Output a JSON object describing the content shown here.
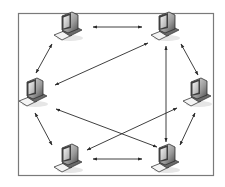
{
  "diagram": {
    "type": "mesh-network-topology",
    "frame": {
      "x": 18,
      "y": 13,
      "width": 195,
      "height": 162,
      "stroke": "#7a7a7a"
    },
    "colors": {
      "arrow": "#2a2a2a",
      "pc_dark": "#3a3a3a",
      "pc_mid": "#8c8c8c",
      "pc_light": "#d8d8d8",
      "pc_screen": "#bcbcbc"
    },
    "nodes": [
      {
        "id": "pc-top-left",
        "x": 68,
        "y": 27
      },
      {
        "id": "pc-top-right",
        "x": 165,
        "y": 27
      },
      {
        "id": "pc-mid-left",
        "x": 33,
        "y": 93
      },
      {
        "id": "pc-mid-right",
        "x": 197,
        "y": 93
      },
      {
        "id": "pc-bottom-left",
        "x": 68,
        "y": 159
      },
      {
        "id": "pc-bottom-right",
        "x": 165,
        "y": 159
      }
    ],
    "edges": [
      {
        "from": "pc-top-left",
        "to": "pc-top-right",
        "x1": 93,
        "y1": 27,
        "x2": 142,
        "y2": 27
      },
      {
        "from": "pc-top-left",
        "to": "pc-mid-left",
        "x1": 52,
        "y1": 44,
        "x2": 36,
        "y2": 73
      },
      {
        "from": "pc-top-right",
        "to": "pc-mid-right",
        "x1": 181,
        "y1": 44,
        "x2": 198,
        "y2": 75
      },
      {
        "from": "pc-top-right",
        "to": "pc-mid-left",
        "x1": 148,
        "y1": 43,
        "x2": 55,
        "y2": 85
      },
      {
        "from": "pc-top-right",
        "to": "pc-bottom-right",
        "x1": 166,
        "y1": 46,
        "x2": 166,
        "y2": 142
      },
      {
        "from": "pc-mid-left",
        "to": "pc-bottom-left",
        "x1": 35,
        "y1": 113,
        "x2": 52,
        "y2": 145
      },
      {
        "from": "pc-mid-left",
        "to": "pc-bottom-right",
        "x1": 56,
        "y1": 109,
        "x2": 157,
        "y2": 147
      },
      {
        "from": "pc-mid-right",
        "to": "pc-bottom-left",
        "x1": 177,
        "y1": 108,
        "x2": 87,
        "y2": 150
      },
      {
        "from": "pc-mid-right",
        "to": "pc-bottom-right",
        "x1": 195,
        "y1": 113,
        "x2": 180,
        "y2": 145
      },
      {
        "from": "pc-bottom-left",
        "to": "pc-bottom-right",
        "x1": 93,
        "y1": 159,
        "x2": 142,
        "y2": 159
      }
    ]
  }
}
